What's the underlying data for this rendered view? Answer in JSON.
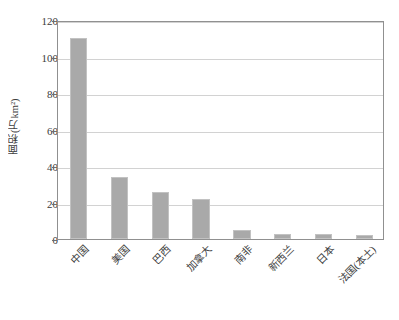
{
  "chart_data": {
    "type": "bar",
    "title": "",
    "xlabel": "",
    "ylabel": "面积(万km²)",
    "categories": [
      "中国",
      "美国",
      "巴西",
      "加拿大",
      "南非",
      "新西兰",
      "日本",
      "法国(本土)"
    ],
    "values": [
      110,
      34,
      26,
      22,
      5,
      3,
      3,
      2
    ],
    "ylim": [
      0,
      120
    ],
    "yticks": [
      0,
      20,
      40,
      60,
      80,
      100,
      120
    ],
    "ytick_labels": [
      "0",
      "20",
      "40",
      "60",
      "80",
      "100",
      "120"
    ],
    "grid": true,
    "legend": "none",
    "series": [
      {
        "name": "面积",
        "values": [
          110,
          34,
          26,
          22,
          5,
          3,
          3,
          2
        ]
      }
    ],
    "colors": {
      "bar_fill": "#a9a9a9",
      "bar_border": "#c2c2c2",
      "gridline": "#d2d2d2",
      "axis": "#909090",
      "text": "#3a3a3a"
    }
  }
}
